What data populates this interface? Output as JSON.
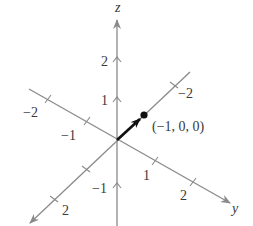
{
  "diagram": {
    "type": "3d-coordinate-axes",
    "colors": {
      "axis": "#8a8a8a",
      "vector": "#111111",
      "point": "#111111",
      "text": "#3a3a3a"
    },
    "axes": {
      "z": {
        "label": "z",
        "ticks": [
          {
            "value": "2",
            "label": "2"
          },
          {
            "value": "1",
            "label": "1"
          },
          {
            "value": "-1",
            "label": "−1"
          }
        ]
      },
      "y": {
        "label": "y",
        "ticks": [
          {
            "value": "-2",
            "label": "−2"
          },
          {
            "value": "-1",
            "label": "−1"
          },
          {
            "value": "1",
            "label": "1"
          },
          {
            "value": "2",
            "label": "2"
          }
        ]
      },
      "x": {
        "label": "",
        "ticks": [
          {
            "value": "-2",
            "label": "−2"
          },
          {
            "value": "2",
            "label": "2"
          }
        ]
      }
    },
    "point": {
      "coords": "(−1, 0, 0)",
      "label": "(−1, 0, 0)"
    },
    "vector": {
      "from": "origin",
      "to": "(−1, 0, 0)"
    }
  }
}
